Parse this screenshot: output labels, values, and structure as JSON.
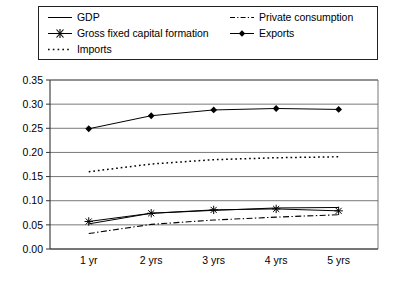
{
  "legend": {
    "entries": [
      {
        "label": "GDP",
        "style": "solid-thin",
        "marker": "none",
        "col": 0,
        "row": 0
      },
      {
        "label": "Gross fixed capital formation",
        "style": "solid-thin",
        "marker": "asterisk",
        "col": 0,
        "row": 1
      },
      {
        "label": "Imports",
        "style": "dotted",
        "marker": "none",
        "col": 0,
        "row": 2
      },
      {
        "label": "Private consumption",
        "style": "dash-dot",
        "marker": "none",
        "col": 1,
        "row": 0
      },
      {
        "label": "Exports",
        "style": "solid-thin",
        "marker": "diamond",
        "col": 1,
        "row": 1
      }
    ]
  },
  "axes": {
    "y_ticks": [
      "0.00",
      "0.05",
      "0.10",
      "0.15",
      "0.20",
      "0.25",
      "0.30",
      "0.35"
    ],
    "x_ticks": [
      "1 yr",
      "2 yrs",
      "3 yrs",
      "4 yrs",
      "5 yrs"
    ]
  },
  "chart_data": {
    "type": "line",
    "title": "",
    "xlabel": "",
    "ylabel": "",
    "categories": [
      "1 yr",
      "2 yrs",
      "3 yrs",
      "4 yrs",
      "5 yrs"
    ],
    "ylim": [
      0.0,
      0.35
    ],
    "ytick_step": 0.05,
    "grid": true,
    "legend_position": "top",
    "series": [
      {
        "name": "GDP",
        "values": [
          0.052,
          0.074,
          0.08,
          0.085,
          0.086
        ],
        "style": "solid-thin",
        "marker": "none",
        "color": "#000000"
      },
      {
        "name": "Gross fixed capital formation",
        "values": [
          0.057,
          0.074,
          0.081,
          0.083,
          0.079
        ],
        "style": "solid-thin",
        "marker": "asterisk",
        "color": "#000000"
      },
      {
        "name": "Imports",
        "values": [
          0.16,
          0.176,
          0.185,
          0.189,
          0.191
        ],
        "style": "dotted",
        "marker": "none",
        "color": "#000000"
      },
      {
        "name": "Private consumption",
        "values": [
          0.032,
          0.051,
          0.06,
          0.066,
          0.071
        ],
        "style": "dash-dot",
        "marker": "none",
        "color": "#000000"
      },
      {
        "name": "Exports",
        "values": [
          0.249,
          0.276,
          0.288,
          0.291,
          0.289
        ],
        "style": "solid-thin",
        "marker": "diamond",
        "color": "#000000"
      }
    ]
  }
}
